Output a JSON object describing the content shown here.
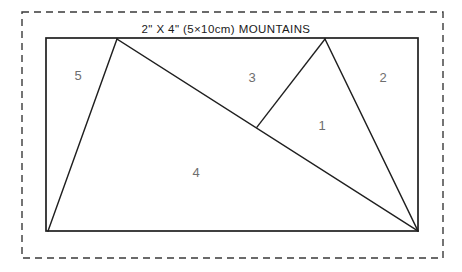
{
  "diagram": {
    "title": "2\" X 4\" (5×10cm) MOUNTAINS",
    "title_position": {
      "x": 226,
      "y": 33
    },
    "colors": {
      "background": "#ffffff",
      "dashed_border": "#3a3a3a",
      "panel_stroke": "#1f1f1f",
      "cut_line": "#1f1f1f",
      "label_text": "#6e6e6e",
      "title_text": "#1a1a1a"
    },
    "outer_boundary": {
      "name": "dashed-trim-boundary",
      "style": "dashed",
      "x": 22,
      "y": 12,
      "width": 421,
      "height": 246
    },
    "panel": {
      "name": "block-rectangle",
      "x": 46,
      "y": 38,
      "width": 372,
      "height": 193
    },
    "vertices": {
      "top_left": {
        "x": 46,
        "y": 38
      },
      "top_right": {
        "x": 418,
        "y": 38
      },
      "bottom_left": {
        "x": 46,
        "y": 231
      },
      "bottom_right": {
        "x": 418,
        "y": 231
      },
      "left_peak_apex": {
        "x": 117,
        "y": 39
      },
      "left_base": {
        "x": 48,
        "y": 231
      },
      "right_peak_apex": {
        "x": 325,
        "y": 39
      },
      "junction": {
        "x": 257,
        "y": 127
      }
    },
    "cut_lines": [
      {
        "name": "left-peak-left-slope",
        "points": "117,39 48,231"
      },
      {
        "name": "long-diagonal",
        "points": "117,39 418,231"
      },
      {
        "name": "right-peak-left-slope",
        "points": "325,39 257,127"
      },
      {
        "name": "right-peak-right-slope",
        "points": "325,39 418,231"
      }
    ],
    "region_labels": [
      {
        "name": "region-label-5",
        "text": "5",
        "x": 78,
        "y": 80
      },
      {
        "name": "region-label-3",
        "text": "3",
        "x": 252,
        "y": 82
      },
      {
        "name": "region-label-2",
        "text": "2",
        "x": 383,
        "y": 82
      },
      {
        "name": "region-label-1",
        "text": "1",
        "x": 322,
        "y": 130
      },
      {
        "name": "region-label-4",
        "text": "4",
        "x": 196,
        "y": 177
      }
    ]
  }
}
